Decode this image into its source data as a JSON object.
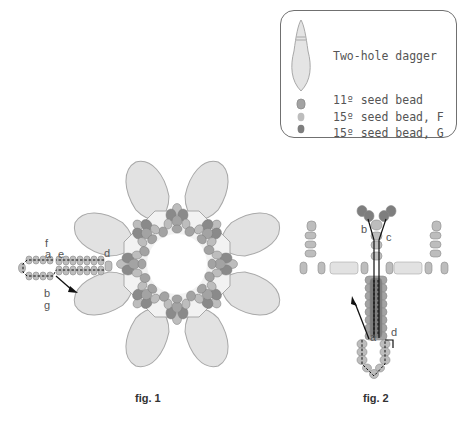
{
  "legend": {
    "items": [
      {
        "icon": "two-hole-dagger-icon",
        "label": "Two-hole dagger",
        "color": "#dcdcdc"
      },
      {
        "icon": "seed-bead-11-icon",
        "label": "11º seed bead",
        "color": "#9a9a9a"
      },
      {
        "icon": "seed-bead-15-f-icon",
        "label": "15º seed bead, F",
        "color": "#b4b4b4"
      },
      {
        "icon": "seed-bead-15-g-icon",
        "label": "15º seed bead, G",
        "color": "#7c7c7c"
      }
    ]
  },
  "figures": [
    {
      "caption": "fig. 1",
      "path_labels": [
        "f",
        "a",
        "e",
        "d",
        "b",
        "g"
      ]
    },
    {
      "caption": "fig. 2",
      "path_labels": [
        "b",
        "c",
        "a",
        "d"
      ]
    }
  ],
  "colors": {
    "dagger_fill": "#e2e2e2",
    "dagger_stroke": "#a8a8a8",
    "bead_11": "#a3a3a3",
    "bead_15f": "#bdbdbd",
    "bead_15g": "#7e7e7e",
    "thread": "#111111"
  }
}
